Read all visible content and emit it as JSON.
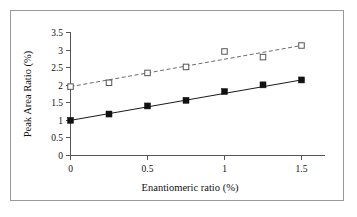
{
  "chart_data": {
    "type": "scatter",
    "title": "",
    "xlabel": "Enantiomeric ratio (%)",
    "ylabel": "Peak Area Ratio (%)",
    "xlim": [
      0,
      1.6
    ],
    "ylim": [
      0,
      3.5
    ],
    "grid": false,
    "legend": "none",
    "xticks": [
      "0",
      "0.5",
      "1",
      "1.5"
    ],
    "xtick_values": [
      0,
      0.5,
      1,
      1.5
    ],
    "yticks": [
      "0",
      "0.5",
      "1",
      "1.5",
      "2",
      "2.5",
      "3",
      "3.5"
    ],
    "ytick_values": [
      0,
      0.5,
      1,
      1.5,
      2,
      2.5,
      3,
      3.5
    ],
    "x": [
      0,
      0.25,
      0.5,
      0.75,
      1,
      1.25,
      1.5
    ],
    "series": [
      {
        "name": "filled-square-series",
        "marker": "filled-square",
        "linestyle": "solid",
        "color": "#111111",
        "values": [
          1.0,
          1.18,
          1.41,
          1.57,
          1.82,
          2.01,
          2.15
        ]
      },
      {
        "name": "open-square-series",
        "marker": "open-square",
        "linestyle": "dashed",
        "color": "#6b6b6b",
        "values": [
          1.96,
          2.07,
          2.35,
          2.52,
          2.96,
          2.8,
          3.13
        ]
      }
    ],
    "trendlines": [
      {
        "name": "solid-trendline",
        "for_series": "filled-square-series",
        "x": [
          0,
          1.5
        ],
        "y": [
          1.0,
          2.15
        ]
      },
      {
        "name": "dashed-trendline",
        "for_series": "open-square-series",
        "x": [
          0,
          1.5
        ],
        "y": [
          1.96,
          3.13
        ]
      }
    ]
  },
  "axis": {
    "x_title": "Enantiomeric ratio (%)",
    "y_title": "Peak Area Ratio (%)",
    "x_tick_labels": [
      "0",
      "0.5",
      "1",
      "1.5"
    ],
    "y_tick_labels": [
      "3.5",
      "3",
      "2.5",
      "2",
      "1.5",
      "1",
      "0.5",
      "0"
    ]
  },
  "colors": {
    "frame": "#9a9a9a",
    "axis": "#555555",
    "filled_marker": "#111111",
    "open_marker_stroke": "#555555",
    "dashed_line": "#6b6b6b",
    "background": "#ffffff"
  }
}
